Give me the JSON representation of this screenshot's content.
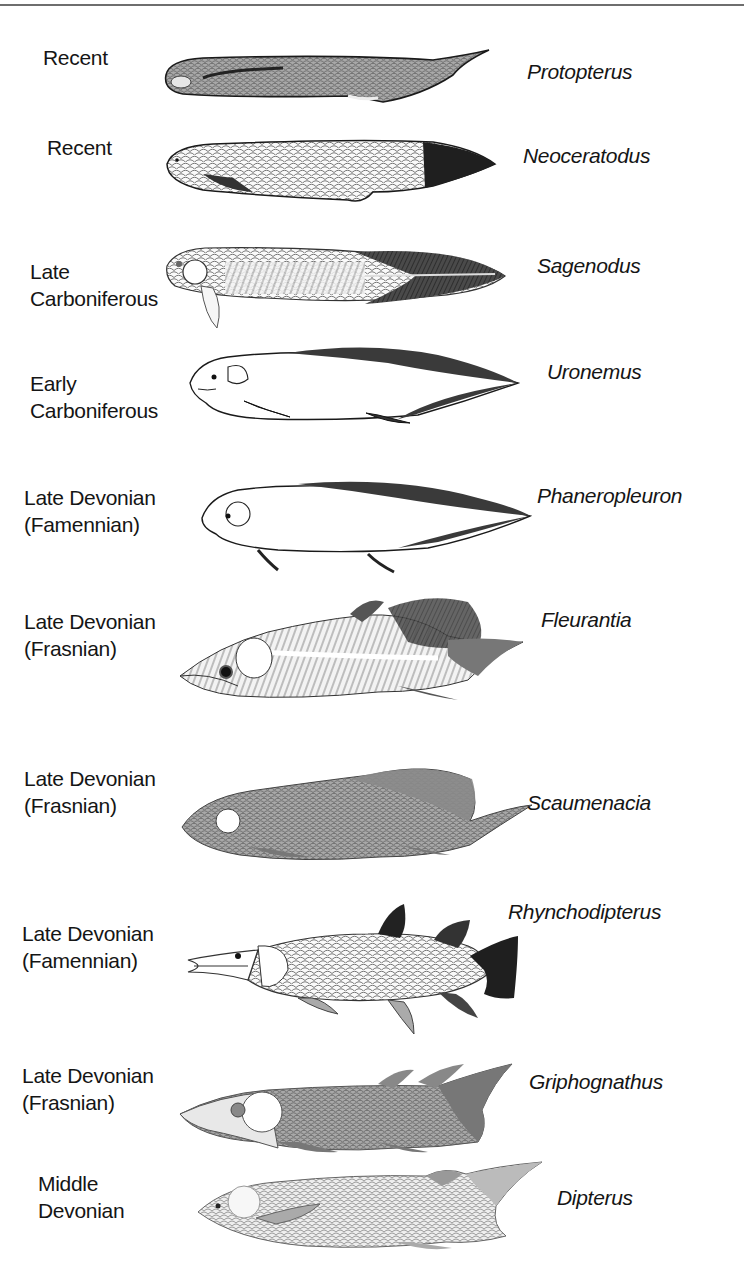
{
  "figure": {
    "rows": [
      {
        "era": "Recent",
        "taxon": "Protopterus"
      },
      {
        "era": "Recent",
        "taxon": "Neoceratodus"
      },
      {
        "era": "Late\nCarboniferous",
        "taxon": "Sagenodus"
      },
      {
        "era": "Early\nCarboniferous",
        "taxon": "Uronemus"
      },
      {
        "era": "Late Devonian\n(Famennian)",
        "taxon": "Phaneropleuron"
      },
      {
        "era": "Late Devonian\n(Frasnian)",
        "taxon": "Fleurantia"
      },
      {
        "era": "Late Devonian\n(Frasnian)",
        "taxon": "Scaumenacia"
      },
      {
        "era": "Late Devonian\n(Famennian)",
        "taxon": "Rhynchodipterus"
      },
      {
        "era": "Late Devonian\n(Frasnian)",
        "taxon": "Griphognathus"
      },
      {
        "era": "Middle\nDevonian",
        "taxon": "Dipterus"
      }
    ]
  },
  "colors": {
    "ink": "#151515",
    "rule": "#6e6e6e",
    "dark_fin": "#3a3a3a",
    "mid_body": "#9a9a9a",
    "light_body": "#d8d8d8"
  }
}
